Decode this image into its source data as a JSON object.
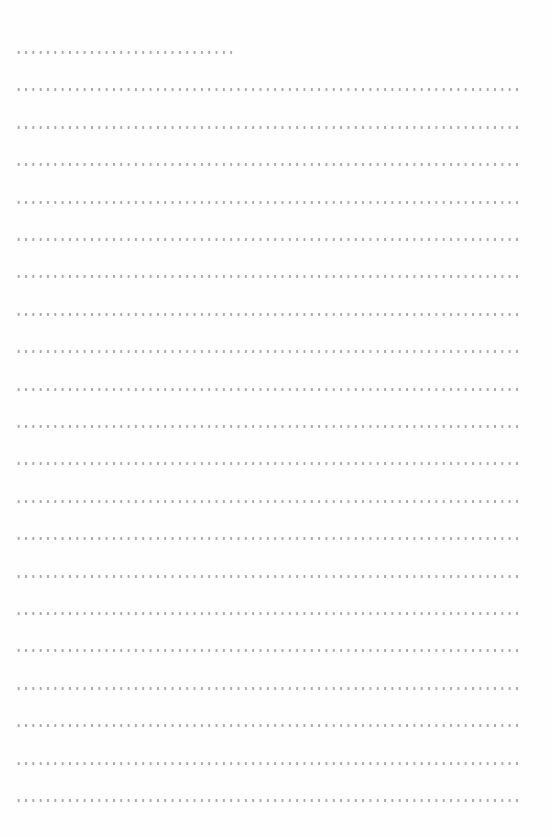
{
  "page": {
    "type": "dotted-lined-writing-sheet",
    "background_color": "#fefefe",
    "dot_color": "#a9a9a9",
    "line_left_x": 15,
    "first_line_y": 51,
    "line_spacing": 37.4,
    "full_line_width": 504,
    "lines": [
      {
        "index": 0,
        "kind": "short",
        "width": 218
      },
      {
        "index": 1,
        "kind": "full"
      },
      {
        "index": 2,
        "kind": "full"
      },
      {
        "index": 3,
        "kind": "full"
      },
      {
        "index": 4,
        "kind": "full"
      },
      {
        "index": 5,
        "kind": "full"
      },
      {
        "index": 6,
        "kind": "full"
      },
      {
        "index": 7,
        "kind": "full"
      },
      {
        "index": 8,
        "kind": "full"
      },
      {
        "index": 9,
        "kind": "full"
      },
      {
        "index": 10,
        "kind": "full"
      },
      {
        "index": 11,
        "kind": "full"
      },
      {
        "index": 12,
        "kind": "full"
      },
      {
        "index": 13,
        "kind": "full"
      },
      {
        "index": 14,
        "kind": "full"
      },
      {
        "index": 15,
        "kind": "full"
      },
      {
        "index": 16,
        "kind": "full"
      },
      {
        "index": 17,
        "kind": "full"
      },
      {
        "index": 18,
        "kind": "full"
      },
      {
        "index": 19,
        "kind": "full"
      },
      {
        "index": 20,
        "kind": "full"
      }
    ]
  }
}
